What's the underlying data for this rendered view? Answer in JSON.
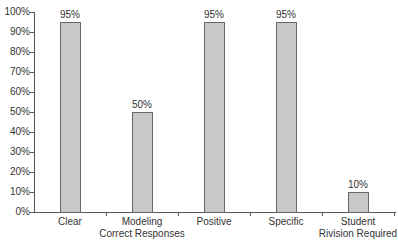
{
  "chart_data": {
    "type": "bar",
    "title": "",
    "xlabel": "",
    "ylabel": "",
    "categories": [
      "Clear",
      "Modeling\nCorrect Responses",
      "Positive",
      "Specific",
      "Student\nRivision Required"
    ],
    "values": [
      95,
      50,
      95,
      95,
      10
    ],
    "value_labels": [
      "95%",
      "50%",
      "95%",
      "95%",
      "10%"
    ],
    "ylim": [
      0,
      100
    ],
    "y_ticks": [
      "0%",
      "10%",
      "20%",
      "30%",
      "40%",
      "50%",
      "60%",
      "70%",
      "80%",
      "90%",
      "100%"
    ],
    "grid": false,
    "legend": null,
    "bar_color": "#c8c8c8",
    "bar_edge_color": "#666666"
  }
}
